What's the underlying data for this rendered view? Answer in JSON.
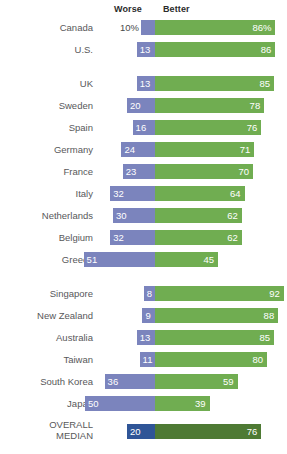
{
  "legend": {
    "worse_label": "Worse",
    "better_label": "Better"
  },
  "colors": {
    "worse": "#7b84bd",
    "better": "#70ad51",
    "worse_median": "#2f5597",
    "better_median": "#4e7a34",
    "background": "#ffffff",
    "label_text": "#58585a"
  },
  "chart_data": {
    "type": "bar",
    "subtype": "diverging-stacked-bar",
    "title": "",
    "xlabel": "",
    "ylabel": "",
    "legend_position": "top",
    "legend": [
      "Worse",
      "Better"
    ],
    "grid": false,
    "xlim": [
      -60,
      100
    ],
    "center_value": 0,
    "categories": [
      "Canada",
      "U.S.",
      "UK",
      "Sweden",
      "Spain",
      "Germany",
      "France",
      "Italy",
      "Netherlands",
      "Belgium",
      "Greece",
      "Singapore",
      "New Zealand",
      "Australia",
      "Taiwan",
      "South Korea",
      "Japan",
      "OVERALL MEDIAN"
    ],
    "series": [
      {
        "name": "Worse",
        "values": [
          10,
          13,
          13,
          20,
          16,
          24,
          23,
          32,
          30,
          32,
          51,
          8,
          9,
          13,
          11,
          36,
          50,
          20
        ]
      },
      {
        "name": "Better",
        "values": [
          86,
          86,
          85,
          78,
          76,
          71,
          70,
          64,
          62,
          62,
          45,
          92,
          88,
          85,
          80,
          59,
          39,
          76
        ]
      }
    ],
    "groups": [
      {
        "name": "North America",
        "categories": [
          "Canada",
          "U.S."
        ]
      },
      {
        "name": "Europe",
        "categories": [
          "UK",
          "Sweden",
          "Spain",
          "Germany",
          "France",
          "Italy",
          "Netherlands",
          "Belgium",
          "Greece"
        ]
      },
      {
        "name": "Asia-Pacific",
        "categories": [
          "Singapore",
          "New Zealand",
          "Australia",
          "Taiwan",
          "South Korea",
          "Japan"
        ]
      },
      {
        "name": "Summary",
        "categories": [
          "OVERALL MEDIAN"
        ]
      }
    ]
  },
  "rows": [
    {
      "label": "Canada",
      "worse": "10%",
      "better": "86%",
      "worse_val": 10,
      "better_val": 86,
      "top": 20,
      "group": 0,
      "worse_outside": true,
      "median": false
    },
    {
      "label": "U.S.",
      "worse": "13",
      "better": "86",
      "worse_val": 13,
      "better_val": 86,
      "top": 42,
      "group": 0,
      "worse_outside": false,
      "median": false
    },
    {
      "label": "UK",
      "worse": "13",
      "better": "85",
      "worse_val": 13,
      "better_val": 85,
      "top": 76,
      "group": 1,
      "worse_outside": false,
      "median": false
    },
    {
      "label": "Sweden",
      "worse": "20",
      "better": "78",
      "worse_val": 20,
      "better_val": 78,
      "top": 98,
      "group": 1,
      "worse_outside": false,
      "median": false
    },
    {
      "label": "Spain",
      "worse": "16",
      "better": "76",
      "worse_val": 16,
      "better_val": 76,
      "top": 120,
      "group": 1,
      "worse_outside": false,
      "median": false
    },
    {
      "label": "Germany",
      "worse": "24",
      "better": "71",
      "worse_val": 24,
      "better_val": 71,
      "top": 142,
      "group": 1,
      "worse_outside": false,
      "median": false
    },
    {
      "label": "France",
      "worse": "23",
      "better": "70",
      "worse_val": 23,
      "better_val": 70,
      "top": 164,
      "group": 1,
      "worse_outside": false,
      "median": false
    },
    {
      "label": "Italy",
      "worse": "32",
      "better": "64",
      "worse_val": 32,
      "better_val": 64,
      "top": 186,
      "group": 1,
      "worse_outside": false,
      "median": false
    },
    {
      "label": "Netherlands",
      "worse": "30",
      "better": "62",
      "worse_val": 30,
      "better_val": 62,
      "top": 208,
      "group": 1,
      "worse_outside": false,
      "median": false
    },
    {
      "label": "Belgium",
      "worse": "32",
      "better": "62",
      "worse_val": 32,
      "better_val": 62,
      "top": 230,
      "group": 1,
      "worse_outside": false,
      "median": false
    },
    {
      "label": "Greece",
      "worse": "51",
      "better": "45",
      "worse_val": 51,
      "better_val": 45,
      "top": 252,
      "group": 1,
      "worse_outside": false,
      "median": false
    },
    {
      "label": "Singapore",
      "worse": "8",
      "better": "92",
      "worse_val": 8,
      "better_val": 92,
      "top": 286,
      "group": 2,
      "worse_outside": false,
      "median": false
    },
    {
      "label": "New Zealand",
      "worse": "9",
      "better": "88",
      "worse_val": 9,
      "better_val": 88,
      "top": 308,
      "group": 2,
      "worse_outside": false,
      "median": false
    },
    {
      "label": "Australia",
      "worse": "13",
      "better": "85",
      "worse_val": 13,
      "better_val": 85,
      "top": 330,
      "group": 2,
      "worse_outside": false,
      "median": false
    },
    {
      "label": "Taiwan",
      "worse": "11",
      "better": "80",
      "worse_val": 11,
      "better_val": 80,
      "top": 352,
      "group": 2,
      "worse_outside": false,
      "median": false
    },
    {
      "label": "South Korea",
      "worse": "36",
      "better": "59",
      "worse_val": 36,
      "better_val": 59,
      "top": 374,
      "group": 2,
      "worse_outside": false,
      "median": false
    },
    {
      "label": "Japan",
      "worse": "50",
      "better": "39",
      "worse_val": 50,
      "better_val": 39,
      "top": 396,
      "group": 2,
      "worse_outside": false,
      "median": false
    },
    {
      "label": "OVERALL MEDIAN",
      "worse": "20",
      "better": "76",
      "worse_val": 20,
      "better_val": 76,
      "top": 424,
      "group": 3,
      "worse_outside": false,
      "median": true
    }
  ],
  "layout": {
    "center_x": 155,
    "px_per_unit": 1.4,
    "bar_height": 15
  }
}
